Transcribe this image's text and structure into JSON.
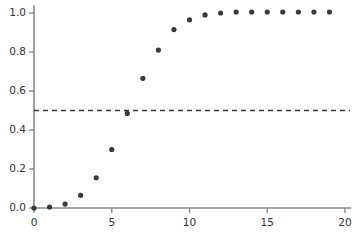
{
  "chart_data": {
    "type": "scatter",
    "title": "",
    "subtitle": "",
    "xlabel": "",
    "ylabel": "",
    "x": [
      0,
      1,
      2,
      3,
      4,
      5,
      6,
      7,
      8,
      9,
      10,
      11,
      12,
      13,
      14,
      15,
      16,
      17,
      18,
      19
    ],
    "values": [
      0.0,
      0.005,
      0.02,
      0.065,
      0.155,
      0.3,
      0.485,
      0.665,
      0.81,
      0.915,
      0.965,
      0.99,
      1.0,
      1.005,
      1.005,
      1.005,
      1.005,
      1.005,
      1.005,
      1.005
    ],
    "series": [
      {
        "name": "data",
        "marker": "filled-circle",
        "color": "#3a3a3a",
        "values": [
          0.0,
          0.005,
          0.02,
          0.065,
          0.155,
          0.3,
          0.485,
          0.665,
          0.81,
          0.915,
          0.965,
          0.99,
          1.0,
          1.005,
          1.005,
          1.005,
          1.005,
          1.005,
          1.005,
          1.005
        ]
      }
    ],
    "annotations": [
      {
        "type": "horizontal-dashed-line",
        "name": "half-reference-line",
        "y": 0.5,
        "color": "#3a3a3a",
        "dash": "5,4"
      }
    ],
    "xlim": [
      0,
      20.4
    ],
    "ylim": [
      0,
      1.04
    ],
    "xticks": [
      0,
      5,
      10,
      15,
      20
    ],
    "xtick_labels": [
      "0",
      "5",
      "10",
      "15",
      "20"
    ],
    "yticks": [
      0.0,
      0.2,
      0.4,
      0.6,
      0.8,
      1.0
    ],
    "ytick_labels": [
      "0.0",
      "0.2",
      "0.4",
      "0.6",
      "0.8",
      "1.0"
    ],
    "grid": false,
    "legend": "none",
    "axis_color": "#8a8a8a",
    "tick_label_color": "#333333",
    "background": "#ffffff"
  },
  "geometry": {
    "x0_px": 34,
    "x20_px": 345,
    "y0_px": 208,
    "y1_px": 13,
    "dot_radius_px": 2.6,
    "dash_line_end_px": 350
  }
}
